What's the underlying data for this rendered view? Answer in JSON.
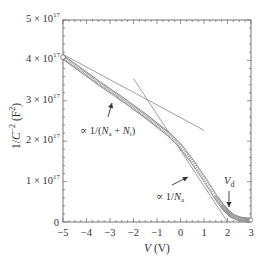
{
  "chart_data": {
    "type": "scatter",
    "title": "",
    "xlabel": "V (V)",
    "ylabel": "1/C^-2 (F^2)",
    "xlim": [
      -5,
      3
    ],
    "ylim": [
      0,
      5e+17
    ],
    "grid": false,
    "x_ticks": [
      "-5",
      "-4",
      "-3",
      "-2",
      "-1",
      "0",
      "1",
      "2",
      "3"
    ],
    "y_ticks": [
      "0",
      "1 × 10^17",
      "2 × 10^17",
      "3 × 10^17",
      "4 × 10^17",
      "5 × 10^17"
    ],
    "series": [
      {
        "name": "measured 1/C^2",
        "marker": "open-circle",
        "x": [
          -5.0,
          -4.5,
          -4.0,
          -3.5,
          -3.0,
          -2.5,
          -2.0,
          -1.5,
          -1.0,
          -0.5,
          0.0,
          0.5,
          1.0,
          1.5,
          1.8,
          2.0,
          2.2,
          2.5,
          2.8,
          3.0
        ],
        "y": [
          4.08e+17,
          3.87e+17,
          3.66e+17,
          3.45e+17,
          3.25e+17,
          3.05e+17,
          2.84e+17,
          2.63e+17,
          2.4e+17,
          2.17e+17,
          1.88e+17,
          1.5e+17,
          1.08e+17,
          6.2e+16,
          3.8e+16,
          2.5e+16,
          1.5e+16,
          8000000000000000.0,
          5000000000000000.0,
          5000000000000000.0
        ]
      },
      {
        "name": "fit ∝ 1/(Na + Nt)",
        "type": "line",
        "x": [
          -5.0,
          1.0
        ],
        "y": [
          4.15e+17,
          2.27e+17
        ]
      },
      {
        "name": "fit ∝ 1/Na",
        "type": "line",
        "x": [
          -2.0,
          2.0
        ],
        "y": [
          3.55e+17,
          0.0
        ]
      }
    ],
    "annotations": [
      {
        "text": "∝ 1/(Na + Nt)",
        "x": -3.6,
        "y": 2.2e+17,
        "arrow_to": [
          -3.3,
          3.45e+17
        ]
      },
      {
        "text": "∝ 1/Na",
        "x": -0.4,
        "y": 4.5e+16,
        "arrow_to": [
          0.2,
          1.05e+17
        ]
      },
      {
        "text": "Vd",
        "x": 2.1,
        "y": 9e+16,
        "arrow_to": [
          2.1,
          2.5e+16
        ]
      }
    ]
  },
  "labels": {
    "xlabel_italic": "V",
    "xlabel_unit": " (V)",
    "ylabel_main": "1/C",
    "ylabel_exp": "−2",
    "ylabel_unit": " (F",
    "ylabel_unit_exp": "2",
    "ylabel_close": ")",
    "annot1_prefix": "∝ 1/(",
    "annot1_n1": "N",
    "annot1_s1": "a",
    "annot1_plus": " + ",
    "annot1_n2": "N",
    "annot1_s2": "t",
    "annot1_suffix": ")",
    "annot2_prefix": "∝ 1/",
    "annot2_n": "N",
    "annot2_s": "a",
    "vd_main": "V",
    "vd_sub": "d",
    "ytick_mantissa": [
      "",
      "1 × 10",
      "2 × 10",
      "3 × 10",
      "4 × 10",
      "5 × 10"
    ],
    "ytick_exp": "17",
    "ytick_zero": "0"
  }
}
